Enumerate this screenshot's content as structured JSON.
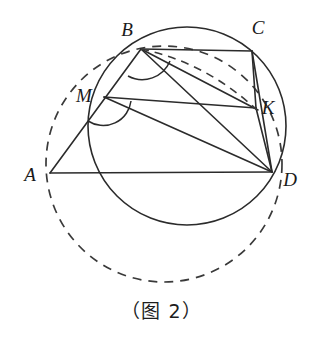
{
  "figure": {
    "caption": "（图 2）",
    "stroke_color": "#2b2b2b",
    "background_color": "#ffffff",
    "points": [
      {
        "id": "A",
        "label": "A",
        "x": 50,
        "y": 173,
        "label_x": 30,
        "label_y": 181
      },
      {
        "id": "B",
        "label": "B",
        "x": 141,
        "y": 49,
        "label_x": 127,
        "label_y": 36
      },
      {
        "id": "C",
        "label": "C",
        "x": 252,
        "y": 51,
        "label_x": 254,
        "label_y": 36
      },
      {
        "id": "D",
        "label": "D",
        "x": 272,
        "y": 172,
        "label_x": 285,
        "label_y": 185
      },
      {
        "id": "K",
        "label": "K",
        "x": 256,
        "y": 108,
        "label_x": 262,
        "label_y": 111
      },
      {
        "id": "M",
        "label": "M",
        "x": 104,
        "y": 97,
        "label_x": 80,
        "label_y": 99
      }
    ],
    "circles": [
      {
        "id": "circumcircle-BCKD",
        "style": "solid",
        "cx": 187,
        "cy": 126,
        "r": 99
      },
      {
        "id": "circumcircle-ABKD",
        "style": "dashed",
        "cx": 164,
        "cy": 164,
        "r": 118
      }
    ],
    "segments": [
      {
        "id": "AB",
        "from": "A",
        "to": "B",
        "style": "solid"
      },
      {
        "id": "AD",
        "from": "A",
        "to": "D",
        "style": "solid"
      },
      {
        "id": "BC",
        "from": "B",
        "to": "C",
        "style": "solid"
      },
      {
        "id": "BK",
        "from": "B",
        "to": "K",
        "style": "solid"
      },
      {
        "id": "BD",
        "from": "B",
        "to": "D",
        "style": "solid"
      },
      {
        "id": "MK",
        "from": "M",
        "to": "K",
        "style": "solid"
      },
      {
        "id": "MD",
        "from": "M",
        "to": "D",
        "style": "solid"
      },
      {
        "id": "CK",
        "from": "C",
        "to": "K",
        "style": "solid"
      },
      {
        "id": "CD",
        "from": "C",
        "to": "D",
        "style": "solid"
      },
      {
        "id": "KD",
        "from": "K",
        "to": "D",
        "style": "solid"
      },
      {
        "id": "BK-dashed-chord",
        "from": "B",
        "to": "K",
        "style": "dashed"
      }
    ],
    "angle_marks": [
      {
        "id": "angle-at-B",
        "vertex": "B",
        "radius": 30
      },
      {
        "id": "angle-at-M",
        "vertex": "M",
        "radius": 28
      }
    ]
  }
}
